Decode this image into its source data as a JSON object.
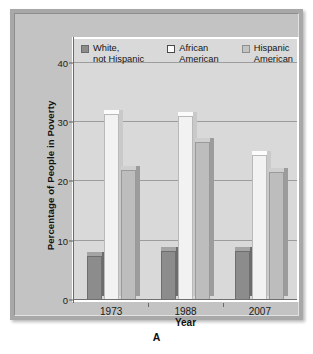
{
  "panel": {
    "letter": "A"
  },
  "legend": {
    "items": [
      {
        "label": "White,\nnot Hispanic",
        "swatch": "legend-swatch-dark-gray",
        "color": "#8c8c8c"
      },
      {
        "label": "African\nAmerican",
        "swatch": "legend-swatch-white",
        "color": "#fbfbfb"
      },
      {
        "label": "Hispanic\nAmerican",
        "swatch": "legend-swatch-light-gray",
        "color": "#c4c4c4"
      }
    ]
  },
  "axes": {
    "y_title": "Percentage of People in Poverty",
    "x_title": "Year",
    "y_ticks": [
      "0",
      "10",
      "20",
      "30",
      "40"
    ],
    "x_ticks": [
      "1973",
      "1988",
      "2007"
    ]
  },
  "chart_data": {
    "type": "bar",
    "title": "",
    "xlabel": "Year",
    "ylabel": "Percentage of People in Poverty",
    "categories": [
      "1973",
      "1988",
      "2007"
    ],
    "series": [
      {
        "name": "White, not Hispanic",
        "color": "#8c8c8c",
        "values": [
          7.5,
          8.2,
          8.2
        ]
      },
      {
        "name": "African American",
        "color": "#f2f2f2",
        "values": [
          31.4,
          31.0,
          24.5
        ]
      },
      {
        "name": "Hispanic American",
        "color": "#bdbdbd",
        "values": [
          21.9,
          26.7,
          21.5
        ]
      }
    ],
    "ylim": [
      0,
      44
    ],
    "yticks": [
      0,
      10,
      20,
      30,
      40
    ],
    "grid": "horizontal",
    "legend_position": "top-inside"
  }
}
